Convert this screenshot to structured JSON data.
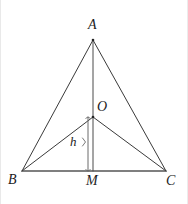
{
  "figure": {
    "type": "geometry-diagram",
    "width": 188,
    "height": 204,
    "background_color": "#ffffff",
    "stroke_color": "#3a3a3a",
    "label_color": "#1c1c1c",
    "points": {
      "A": {
        "label": "A",
        "x": 93,
        "y": 40
      },
      "B": {
        "label": "B",
        "x": 22,
        "y": 171
      },
      "C": {
        "label": "C",
        "x": 166,
        "y": 171
      },
      "M": {
        "label": "M",
        "x": 93,
        "y": 171
      },
      "O": {
        "label": "O",
        "x": 93,
        "y": 117
      }
    },
    "measure": {
      "label": "h",
      "from_x": 88,
      "from_y": 117,
      "to_x": 88,
      "to_y": 171
    },
    "segments": [
      {
        "name": "side-AB",
        "from": "A",
        "to": "B"
      },
      {
        "name": "side-AC",
        "from": "A",
        "to": "C"
      },
      {
        "name": "base-BC",
        "from": "B",
        "to": "C"
      },
      {
        "name": "altitude-AM",
        "from": "A",
        "to": "M"
      },
      {
        "name": "segment-OB",
        "from": "O",
        "to": "B"
      },
      {
        "name": "segment-OC",
        "from": "O",
        "to": "C"
      }
    ]
  }
}
